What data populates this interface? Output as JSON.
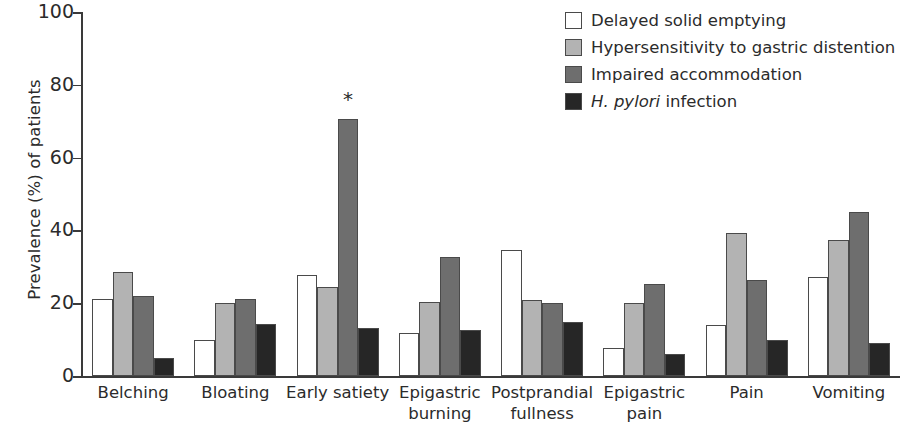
{
  "chart_data": {
    "type": "bar",
    "title": "",
    "xlabel": "",
    "ylabel": "Prevalence (%) of patients",
    "ylim": [
      0,
      100
    ],
    "yticks": [
      0,
      20,
      40,
      60,
      80,
      100
    ],
    "grid": false,
    "legend_position": "top-right",
    "categories": [
      "Belching",
      "Bloating",
      "Early satiety",
      "Epigastric\nburning",
      "Postprandial\nfullness",
      "Epigastric\npain",
      "Pain",
      "Vomiting"
    ],
    "series": [
      {
        "name": "Delayed solid emptying",
        "color": "#ffffff",
        "values": [
          21.2,
          10.0,
          27.8,
          11.8,
          34.5,
          7.8,
          14.0,
          27.2
        ]
      },
      {
        "name": "Hypersensitivity to gastric distention",
        "color": "#b3b3b3",
        "values": [
          28.5,
          20.0,
          24.5,
          20.2,
          20.8,
          20.0,
          39.4,
          37.3
        ]
      },
      {
        "name": "Impaired accommodation",
        "color": "#6e6e6e",
        "values": [
          21.9,
          21.2,
          70.6,
          32.8,
          20.0,
          25.2,
          26.4,
          45.0
        ]
      },
      {
        "name": "H. pylori infection",
        "color": "#262626",
        "values": [
          5.0,
          14.4,
          13.2,
          12.7,
          14.8,
          6.1,
          10.0,
          9.0
        ]
      }
    ],
    "annotations": [
      {
        "text": "*",
        "category": "Early satiety",
        "series": "Impaired accommodation",
        "value": 70.6,
        "meaning": "significance-marker"
      }
    ]
  },
  "legend": {
    "items": [
      {
        "label": "Delayed solid emptying",
        "italic_prefix": "",
        "color": "#ffffff"
      },
      {
        "label": "Hypersensitivity to gastric distention",
        "italic_prefix": "",
        "color": "#b3b3b3"
      },
      {
        "label": "Impaired accommodation",
        "italic_prefix": "",
        "color": "#6e6e6e"
      },
      {
        "label": "infection",
        "italic_prefix": "H. pylori",
        "color": "#262626"
      }
    ]
  },
  "axes": {
    "y_title": "Prevalence (%) of patients",
    "y_tick_labels": [
      "100",
      "80",
      "60",
      "40",
      "20",
      "0"
    ]
  }
}
